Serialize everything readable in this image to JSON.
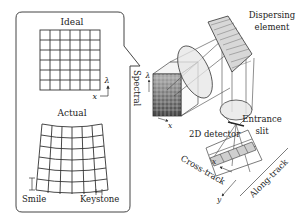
{
  "inset": {
    "ideal_label": "Ideal",
    "actual_label": "Actual",
    "axis_lambda": "λ",
    "axis_x": "x",
    "smile_label": "Smile",
    "keystone_label": "Keystone",
    "grid_cols": 6,
    "grid_rows": 6
  },
  "spectrometer": {
    "spectral_label": "Spectral",
    "detector_axis_lambda": "λ",
    "detector_axis_x": "x",
    "detector_label": "2D detector",
    "dispersing_label_line1": "Dispersing",
    "dispersing_label_line2": "element",
    "slit_label_line1": "Entrance",
    "slit_label_line2": "slit",
    "ground_axis_x": "x",
    "ground_axis_y": "y",
    "cross_track_label": "Cross-track",
    "along_track_label": "Along-track"
  },
  "colors": {
    "line": "#333333",
    "lens_fill": "#e4e4e4",
    "detector_dark": "#555555",
    "grid_fill": "#ffffff"
  }
}
